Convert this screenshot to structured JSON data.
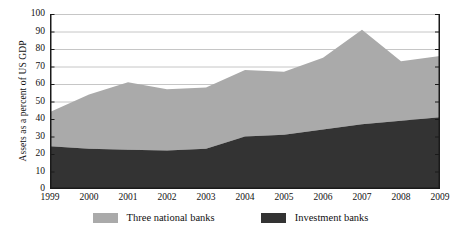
{
  "chart_data": {
    "type": "area",
    "stacked": true,
    "title": "",
    "xlabel": "",
    "ylabel": "Assets as a percent of US GDP",
    "categories": [
      "1999",
      "2000",
      "2001",
      "2002",
      "2003",
      "2004",
      "2005",
      "2006",
      "2007",
      "2008",
      "2009"
    ],
    "x": [
      1999,
      2000,
      2001,
      2002,
      2003,
      2004,
      2005,
      2006,
      2007,
      2008,
      2009
    ],
    "ylim": [
      0,
      100
    ],
    "yticks": [
      0,
      10,
      20,
      30,
      40,
      50,
      60,
      70,
      80,
      90,
      100
    ],
    "ytick_labels": [
      "0",
      "10",
      "20",
      "30",
      "40",
      "50",
      "60",
      "70",
      "80",
      "90",
      "100"
    ],
    "grid": true,
    "grid_axis": "y",
    "legend_position": "bottom",
    "series": [
      {
        "name": "Investment banks",
        "color": "#333333",
        "values": [
          24.5,
          23.0,
          22.5,
          22.0,
          23.0,
          30.0,
          31.0,
          34.0,
          37.0,
          39.0,
          41.0
        ]
      },
      {
        "name": "Three national banks",
        "color": "#aaaaaa",
        "values": [
          19.5,
          31.0,
          38.5,
          35.0,
          35.0,
          38.0,
          36.0,
          41.0,
          54.0,
          34.0,
          35.0
        ]
      }
    ],
    "totals": [
      44,
      54,
      61,
      57,
      58,
      68,
      67,
      75,
      91,
      73,
      76
    ],
    "annotations": []
  },
  "legend": {
    "entries": [
      {
        "label": "Three national banks",
        "color": "#aaaaaa",
        "swatch_name": "legend-swatch-three-national-banks"
      },
      {
        "label": "Investment banks",
        "color": "#333333",
        "swatch_name": "legend-swatch-investment-banks"
      }
    ]
  },
  "colors": {
    "gray_series": "#aaaaaa",
    "dark_series": "#333333",
    "axis": "#1a1a1a",
    "grid": "#bfbfbf",
    "background": "#ffffff",
    "text": "#111111"
  }
}
